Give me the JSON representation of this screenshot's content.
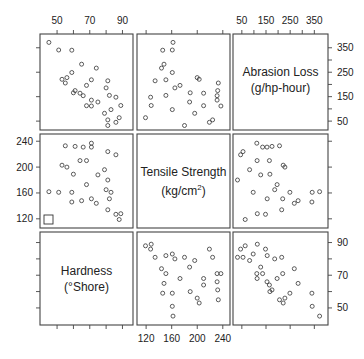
{
  "chart_data": {
    "type": "scatter",
    "title": "",
    "layout": "scatterplot-matrix 3x3",
    "variables": [
      {
        "key": "hardness",
        "label": "Hardness",
        "unit": "(°Shore)",
        "range": [
          42,
          94
        ],
        "ticks": [
          50,
          60,
          70,
          80,
          90
        ],
        "tick_labels": [
          "50",
          "70",
          "90"
        ]
      },
      {
        "key": "tensile",
        "label": "Tensile Strength",
        "unit": "(kg/cm2)",
        "range": [
          112,
          245
        ],
        "ticks": [
          120,
          160,
          200,
          240
        ],
        "tick_labels": [
          "120",
          "160",
          "200",
          "240"
        ]
      },
      {
        "key": "abrasion",
        "label": "Abrasion Loss",
        "unit": "(g/hp-hour)",
        "range": [
          30,
          390
        ],
        "ticks": [
          50,
          100,
          150,
          200,
          250,
          300,
          350
        ],
        "tick_labels": [
          "50",
          "150",
          "250",
          "350"
        ]
      }
    ],
    "diagonal": [
      "Abrasion Loss (g/hp-hour)",
      "Tensile Strength (kg/cm2)",
      "Hardness (°Shore)"
    ],
    "observations": [
      {
        "hardness": 45,
        "tensile": 162,
        "abrasion": 372
      },
      {
        "hardness": 55,
        "tensile": 233,
        "abrasion": 206
      },
      {
        "hardness": 61,
        "tensile": 232,
        "abrasion": 175
      },
      {
        "hardness": 66,
        "tensile": 231,
        "abrasion": 154
      },
      {
        "hardness": 71,
        "tensile": 231,
        "abrasion": 136
      },
      {
        "hardness": 71,
        "tensile": 237,
        "abrasion": 112
      },
      {
        "hardness": 81,
        "tensile": 224,
        "abrasion": 55
      },
      {
        "hardness": 86,
        "tensile": 219,
        "abrasion": 45
      },
      {
        "hardness": 53,
        "tensile": 203,
        "abrasion": 221
      },
      {
        "hardness": 60,
        "tensile": 189,
        "abrasion": 166
      },
      {
        "hardness": 64,
        "tensile": 210,
        "abrasion": 164
      },
      {
        "hardness": 68,
        "tensile": 210,
        "abrasion": 113
      },
      {
        "hardness": 79,
        "tensile": 196,
        "abrasion": 82
      },
      {
        "hardness": 81,
        "tensile": 180,
        "abrasion": 32
      },
      {
        "hardness": 56,
        "tensile": 200,
        "abrasion": 228
      },
      {
        "hardness": 68,
        "tensile": 173,
        "abrasion": 196
      },
      {
        "hardness": 75,
        "tensile": 188,
        "abrasion": 128
      },
      {
        "hardness": 83,
        "tensile": 161,
        "abrasion": 97
      },
      {
        "hardness": 88,
        "tensile": 119,
        "abrasion": 64
      },
      {
        "hardness": 59,
        "tensile": 161,
        "abrasion": 249
      },
      {
        "hardness": 71,
        "tensile": 151,
        "abrasion": 219
      },
      {
        "hardness": 80,
        "tensile": 165,
        "abrasion": 186
      },
      {
        "hardness": 82,
        "tensile": 151,
        "abrasion": 155
      },
      {
        "hardness": 89,
        "tensile": 128,
        "abrasion": 114
      },
      {
        "hardness": 51,
        "tensile": 161,
        "abrasion": 341
      },
      {
        "hardness": 59,
        "tensile": 146,
        "abrasion": 340
      },
      {
        "hardness": 65,
        "tensile": 148,
        "abrasion": 283
      },
      {
        "hardness": 74,
        "tensile": 144,
        "abrasion": 267
      },
      {
        "hardness": 81,
        "tensile": 134,
        "abrasion": 215
      },
      {
        "hardness": 86,
        "tensile": 127,
        "abrasion": 148
      }
    ]
  },
  "panels": {
    "top_axis": {
      "left_ticks": [
        "50",
        "70",
        "90"
      ],
      "right_ticks": [
        "50",
        "150",
        "250",
        "350"
      ]
    },
    "right_axis": {
      "top_ticks": [
        "350",
        "250",
        "150",
        "50"
      ],
      "bottom_ticks": [
        "90",
        "70",
        "50"
      ]
    },
    "left_axis": {
      "mid_ticks": [
        "240",
        "200",
        "160",
        "120"
      ]
    },
    "bottom_axis": {
      "mid_ticks": [
        "120",
        "160",
        "200",
        "240"
      ]
    },
    "diag_labels": {
      "abrasion_1": "Abrasion Loss",
      "abrasion_2": "(g/hp-hour)",
      "tensile_1": "Tensile Strength",
      "tensile_2": "(kg/cm",
      "hardness_1": "Hardness",
      "hardness_2": "(°Shore)"
    }
  }
}
